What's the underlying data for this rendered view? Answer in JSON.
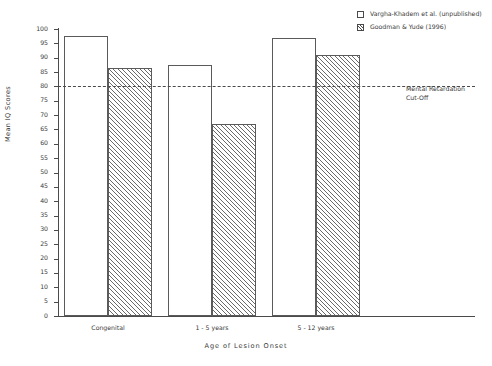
{
  "chart_data": {
    "type": "bar",
    "title": "",
    "xlabel": "Age of Lesion Onset",
    "ylabel": "Mean IQ Scores",
    "categories": [
      "Congenital",
      "1 - 5 years",
      "5 - 12 years"
    ],
    "series": [
      {
        "name": "Vargha-Khadem et al. (unpublished)",
        "style": "open",
        "values": [
          97.5,
          87.5,
          97
        ]
      },
      {
        "name": "Goodman & Yude (1996)",
        "style": "hatched",
        "values": [
          86.5,
          67,
          91
        ]
      }
    ],
    "ylim": [
      0,
      100
    ],
    "ytick_step": 5,
    "yticks": [
      100,
      95,
      90,
      85,
      80,
      75,
      70,
      65,
      60,
      55,
      50,
      45,
      40,
      35,
      30,
      25,
      20,
      15,
      10,
      5,
      0
    ],
    "grid": false,
    "legend_position": "top-right",
    "annotations": [
      {
        "name": "mental-retardation-cutoff",
        "value": 80,
        "line_style": "dashed",
        "text_line_1": "Mental Retardation",
        "text_line_2": "Cut-Off"
      }
    ]
  },
  "legend": {
    "items": [
      {
        "label": "Vargha-Khadem et al. (unpublished)",
        "swatch": "open-square-icon"
      },
      {
        "label": "Goodman & Yude (1996)",
        "swatch": "hatched-square-icon"
      }
    ]
  },
  "axes": {
    "y_title": "Mean IQ Scores",
    "x_title": "Age of Lesion Onset"
  }
}
